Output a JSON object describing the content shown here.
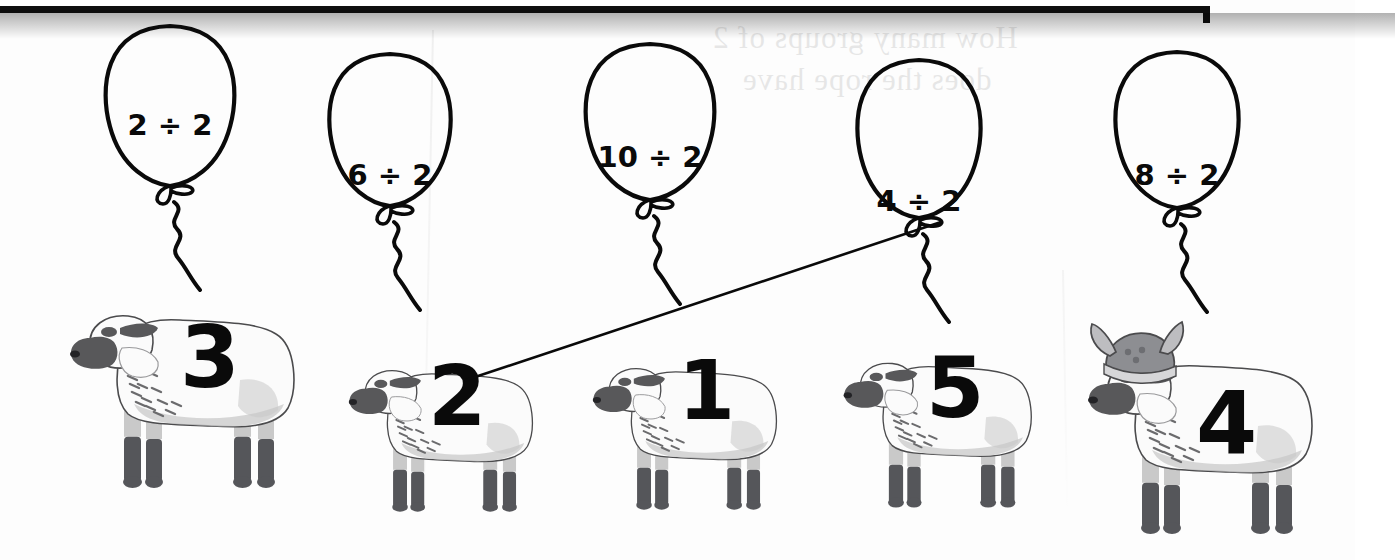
{
  "worksheet": {
    "type": "division-matching-worksheet",
    "theme": "sheep-and-balloons",
    "bleed_through_line1": "How many groups of 2",
    "bleed_through_line2": "does the rope have"
  },
  "balloons": [
    {
      "id": "balloon-1",
      "expression": "2 ÷ 2",
      "dividend": 2,
      "divisor": 2,
      "quotient": 1,
      "x": 96,
      "y": 22,
      "w": 148,
      "h": 160,
      "text_size": 29,
      "text_top": 86
    },
    {
      "id": "balloon-2",
      "expression": "6 ÷ 2",
      "dividend": 6,
      "divisor": 2,
      "quotient": 3,
      "x": 320,
      "y": 50,
      "w": 140,
      "h": 152,
      "text_size": 29,
      "text_top": 108
    },
    {
      "id": "balloon-3",
      "expression": "10 ÷ 2",
      "dividend": 10,
      "divisor": 2,
      "quotient": 5,
      "x": 576,
      "y": 40,
      "w": 148,
      "h": 156,
      "text_size": 29,
      "text_top": 100
    },
    {
      "id": "balloon-4",
      "expression": "4 ÷ 2",
      "dividend": 4,
      "divisor": 2,
      "quotient": 2,
      "x": 848,
      "y": 56,
      "w": 142,
      "h": 158,
      "text_size": 29,
      "text_top": 128
    },
    {
      "id": "balloon-5",
      "expression": "8 ÷ 2",
      "dividend": 8,
      "divisor": 2,
      "quotient": 4,
      "x": 1106,
      "y": 48,
      "w": 142,
      "h": 156,
      "text_size": 29,
      "text_top": 110
    }
  ],
  "sheep": [
    {
      "id": "sheep-1",
      "number": "3",
      "helmet": false,
      "x": 62,
      "y": 276,
      "w": 258,
      "h": 222,
      "num_x": 118,
      "num_y": 38,
      "num_size": 86
    },
    {
      "id": "sheep-2",
      "number": "2",
      "helmet": false,
      "x": 322,
      "y": 338,
      "w": 252,
      "h": 182,
      "num_x": 106,
      "num_y": 16,
      "num_size": 84
    },
    {
      "id": "sheep-3",
      "number": "1",
      "helmet": false,
      "x": 570,
      "y": 336,
      "w": 244,
      "h": 182,
      "num_x": 108,
      "num_y": 14,
      "num_size": 82
    },
    {
      "id": "sheep-4",
      "number": "5",
      "helmet": false,
      "x": 820,
      "y": 330,
      "w": 250,
      "h": 186,
      "num_x": 106,
      "num_y": 16,
      "num_size": 84
    },
    {
      "id": "sheep-5",
      "number": "4",
      "helmet": true,
      "x": 1080,
      "y": 322,
      "w": 258,
      "h": 222,
      "num_x": 116,
      "num_y": 58,
      "num_size": 88
    }
  ],
  "answer_lines": [
    {
      "id": "answer-line-1",
      "from_balloon": "balloon-4",
      "from_expression": "4 ÷ 2",
      "to_sheep": "sheep-2",
      "to_number": "2",
      "x1": 941,
      "y1": 222,
      "x2": 466,
      "y2": 380
    }
  ],
  "colors": {
    "ink": "#0a0a0a",
    "paper": "#fdfdfd",
    "wool_light": "#fbfbfb",
    "wool_shade": "#c9c9c9",
    "face_dark": "#58585a",
    "leg_dark": "#55565a",
    "helmet": "#8d8e92"
  }
}
